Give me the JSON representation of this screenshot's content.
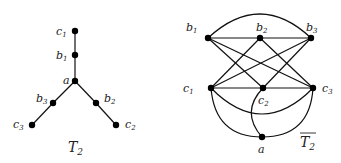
{
  "figures": [
    {
      "name": "T_2",
      "caption": "T",
      "caption_sub": "2",
      "overline": false,
      "nodes": [
        {
          "id": "c1",
          "label": "c",
          "sub": "1",
          "x": 75,
          "y": 31
        },
        {
          "id": "b1",
          "label": "b",
          "sub": "1",
          "x": 75,
          "y": 55
        },
        {
          "id": "a",
          "label": "a",
          "sub": "",
          "x": 75,
          "y": 81
        },
        {
          "id": "b3",
          "label": "b",
          "sub": "3",
          "x": 53,
          "y": 103
        },
        {
          "id": "c3",
          "label": "c",
          "sub": "3",
          "x": 32,
          "y": 125
        },
        {
          "id": "b2",
          "label": "b",
          "sub": "2",
          "x": 96,
          "y": 103
        },
        {
          "id": "c2",
          "label": "c",
          "sub": "2",
          "x": 116,
          "y": 125
        }
      ],
      "edges": [
        [
          "c1",
          "b1"
        ],
        [
          "b1",
          "a"
        ],
        [
          "a",
          "b3"
        ],
        [
          "b3",
          "c3"
        ],
        [
          "a",
          "b2"
        ],
        [
          "b2",
          "c2"
        ]
      ]
    },
    {
      "name": "complement_T_2",
      "caption": "T",
      "caption_sub": "2",
      "overline": true,
      "nodes": [
        {
          "id": "b1",
          "label": "b",
          "sub": "1",
          "x": 208,
          "y": 38
        },
        {
          "id": "b2",
          "label": "b",
          "sub": "2",
          "x": 260,
          "y": 38
        },
        {
          "id": "b3",
          "label": "b",
          "sub": "3",
          "x": 311,
          "y": 38
        },
        {
          "id": "c1",
          "label": "c",
          "sub": "1",
          "x": 211,
          "y": 88
        },
        {
          "id": "c2",
          "label": "c",
          "sub": "2",
          "x": 263,
          "y": 88
        },
        {
          "id": "c3",
          "label": "c",
          "sub": "3",
          "x": 313,
          "y": 88
        },
        {
          "id": "a",
          "label": "a",
          "sub": "",
          "x": 262,
          "y": 137
        }
      ],
      "edges": [
        [
          "b1",
          "b2"
        ],
        [
          "b2",
          "b3"
        ],
        [
          "b1",
          "b3"
        ],
        [
          "b1",
          "c2"
        ],
        [
          "b1",
          "c3"
        ],
        [
          "b2",
          "c1"
        ],
        [
          "b2",
          "c3"
        ],
        [
          "b3",
          "c1"
        ],
        [
          "b3",
          "c2"
        ],
        [
          "c1",
          "c2"
        ],
        [
          "c2",
          "c3"
        ],
        [
          "c1",
          "c3"
        ],
        [
          "c1",
          "a"
        ],
        [
          "c2",
          "a"
        ],
        [
          "c3",
          "a"
        ]
      ]
    }
  ],
  "labels": {
    "left": {
      "c1": "c",
      "c1s": "1",
      "b1": "b",
      "b1s": "1",
      "a": "a",
      "b3": "b",
      "b3s": "3",
      "c3": "c",
      "c3s": "3",
      "b2": "b",
      "b2s": "2",
      "c2": "c",
      "c2s": "2",
      "title": "T",
      "titles": "2"
    },
    "right": {
      "b1": "b",
      "b1s": "1",
      "b2": "b",
      "b2s": "2",
      "b3": "b",
      "b3s": "3",
      "c1": "c",
      "c1s": "1",
      "c2": "c",
      "c2s": "2",
      "c3": "c",
      "c3s": "3",
      "a": "a",
      "title": "T",
      "titles": "2"
    }
  }
}
